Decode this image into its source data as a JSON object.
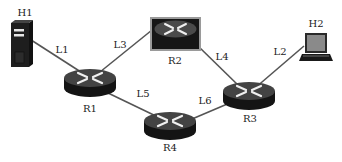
{
  "diagram": {
    "type": "network-topology",
    "colors": {
      "link": "#555555",
      "device_dark": "#1c1c1c",
      "device_top": "#3a3a3a",
      "arrow": "#e8e8e8",
      "label": "#222222"
    },
    "nodes": [
      {
        "id": "H1",
        "label": "H1",
        "kind": "server",
        "x": 21,
        "y": 45
      },
      {
        "id": "H2",
        "label": "H2",
        "kind": "laptop",
        "x": 316,
        "y": 47
      },
      {
        "id": "R1",
        "label": "R1",
        "kind": "router",
        "x": 90,
        "y": 82
      },
      {
        "id": "R2",
        "label": "R2",
        "kind": "router-framed",
        "x": 175,
        "y": 33
      },
      {
        "id": "R3",
        "label": "R3",
        "kind": "router",
        "x": 248,
        "y": 95
      },
      {
        "id": "R4",
        "label": "R4",
        "kind": "router",
        "x": 170,
        "y": 125
      }
    ],
    "links": [
      {
        "id": "L1",
        "label": "L1",
        "from": "H1",
        "to": "R1"
      },
      {
        "id": "L2",
        "label": "L2",
        "from": "R3",
        "to": "H2"
      },
      {
        "id": "L3",
        "label": "L3",
        "from": "R1",
        "to": "R2"
      },
      {
        "id": "L4",
        "label": "L4",
        "from": "R2",
        "to": "R3"
      },
      {
        "id": "L5",
        "label": "L5",
        "from": "R1",
        "to": "R4"
      },
      {
        "id": "L6",
        "label": "L6",
        "from": "R4",
        "to": "R3"
      }
    ]
  }
}
